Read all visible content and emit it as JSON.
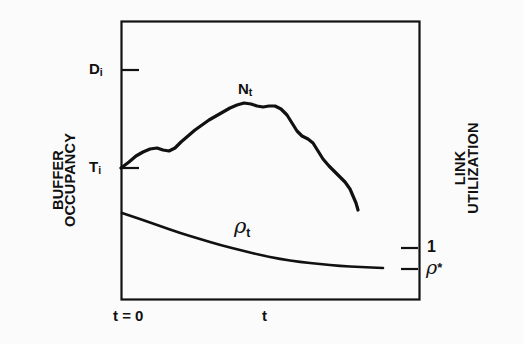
{
  "figure": {
    "background_color": "#fbfbfb",
    "ink_color": "#111111",
    "axis_left_label_line1": "BUFFER",
    "axis_left_label_line2": "OCCUPANCY",
    "axis_right_label_line1": "LINK",
    "axis_right_label_line2": "UTILIZATION",
    "x_axis_origin_label": "t = 0",
    "x_axis_variable_label": "t"
  },
  "ticks": {
    "left": [
      {
        "name": "D-i",
        "label": "D",
        "sub": "i",
        "y_value": 70
      },
      {
        "name": "T-i",
        "label": "T",
        "sub": "i",
        "y_value": 168
      }
    ],
    "right": [
      {
        "name": "one",
        "label": "1",
        "y_value": 248
      },
      {
        "name": "rho-star",
        "label": "ρ",
        "star": "*",
        "y_value": 269
      }
    ]
  },
  "curves": {
    "buffer_occupancy": {
      "label": "N",
      "label_sub": "t",
      "description": "Buffer occupancy N_t rises from T_i, peaks, then decays"
    },
    "link_utilization": {
      "label": "ρ",
      "label_sub": "t",
      "description": "Link utilization rho_t decays monotonically toward rho*"
    }
  },
  "chart_data": {
    "type": "line",
    "title": "",
    "xlabel": "t",
    "ylabel": "BUFFER OCCUPANCY",
    "ylabel_secondary": "LINK UTILIZATION",
    "grid": false,
    "legend": "none",
    "xlim": [
      0,
      1
    ],
    "x_ticks": [
      {
        "position": 0.0,
        "label": "t = 0"
      },
      {
        "position": 0.49,
        "label": "t"
      }
    ],
    "y_ticks_left": [
      {
        "label": "D_i",
        "pixel_y": 70
      },
      {
        "label": "T_i",
        "pixel_y": 168
      }
    ],
    "y_ticks_right": [
      {
        "label": "1",
        "pixel_y": 248
      },
      {
        "label": "rho*",
        "pixel_y": 269
      }
    ],
    "series": [
      {
        "name": "N_t",
        "axis": "left",
        "annotation": "N_t",
        "points": [
          [
            121,
            168
          ],
          [
            129,
            162
          ],
          [
            136,
            156
          ],
          [
            143,
            152
          ],
          [
            150,
            149
          ],
          [
            157,
            148
          ],
          [
            163,
            150
          ],
          [
            169,
            151
          ],
          [
            175,
            148
          ],
          [
            181,
            142
          ],
          [
            188,
            136
          ],
          [
            195,
            130
          ],
          [
            202,
            125
          ],
          [
            209,
            120
          ],
          [
            216,
            116
          ],
          [
            223,
            112
          ],
          [
            230,
            108
          ],
          [
            237,
            105
          ],
          [
            244,
            103
          ],
          [
            251,
            104
          ],
          [
            257,
            106
          ],
          [
            263,
            107
          ],
          [
            269,
            106
          ],
          [
            275,
            106
          ],
          [
            281,
            109
          ],
          [
            287,
            115
          ],
          [
            292,
            123
          ],
          [
            297,
            131
          ],
          [
            302,
            136
          ],
          [
            308,
            139
          ],
          [
            313,
            143
          ],
          [
            318,
            151
          ],
          [
            323,
            159
          ],
          [
            329,
            166
          ],
          [
            335,
            172
          ],
          [
            340,
            177
          ],
          [
            345,
            182
          ],
          [
            350,
            189
          ],
          [
            353,
            196
          ],
          [
            356,
            203
          ],
          [
            358,
            210
          ]
        ]
      },
      {
        "name": "rho_t",
        "axis": "right",
        "annotation": "rho_t",
        "points": [
          [
            122,
            213
          ],
          [
            140,
            219
          ],
          [
            160,
            226
          ],
          [
            180,
            233
          ],
          [
            200,
            239
          ],
          [
            220,
            245
          ],
          [
            240,
            250
          ],
          [
            260,
            255
          ],
          [
            280,
            259
          ],
          [
            300,
            262
          ],
          [
            320,
            264
          ],
          [
            340,
            266
          ],
          [
            360,
            267
          ],
          [
            383,
            268
          ]
        ]
      }
    ],
    "frame": {
      "left": 121,
      "top": 21,
      "right": 419,
      "bottom": 299
    }
  }
}
